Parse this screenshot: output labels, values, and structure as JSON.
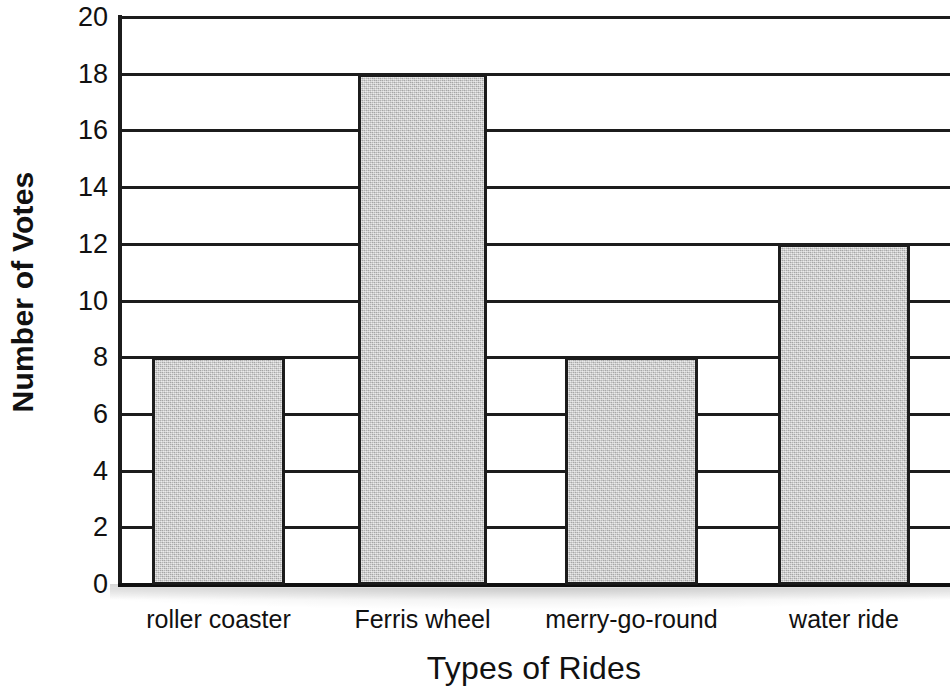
{
  "chart_data": {
    "type": "bar",
    "title": "",
    "xlabel": "Types of Rides",
    "ylabel": "Number of Votes",
    "categories": [
      "roller coaster",
      "Ferris wheel",
      "merry-go-round",
      "water ride"
    ],
    "values": [
      8,
      18,
      8,
      12
    ],
    "ylim": [
      0,
      20
    ],
    "ytick_step": 2,
    "yticks": [
      20,
      18,
      16,
      14,
      12,
      10,
      8,
      6,
      4,
      2,
      0
    ],
    "ytick_labels": [
      "20",
      "18",
      "16",
      "14",
      "12",
      "10",
      "8",
      "6",
      "4",
      "2",
      "0"
    ],
    "grid": "horizontal",
    "legend": "none",
    "bar_fill_color": "#c9c9c9",
    "bar_border_color": "#1c1c1c",
    "axis_color": "#1c1c1c",
    "background_color": "#ffffff",
    "bars": [
      {
        "category": "roller coaster",
        "value": 8,
        "left_px": 152,
        "width_px": 133
      },
      {
        "category": "Ferris wheel",
        "value": 18,
        "left_px": 358,
        "width_px": 129
      },
      {
        "category": "merry-go-round",
        "value": 8,
        "left_px": 565,
        "width_px": 133
      },
      {
        "category": "water ride",
        "value": 12,
        "left_px": 778,
        "width_px": 132
      }
    ]
  }
}
